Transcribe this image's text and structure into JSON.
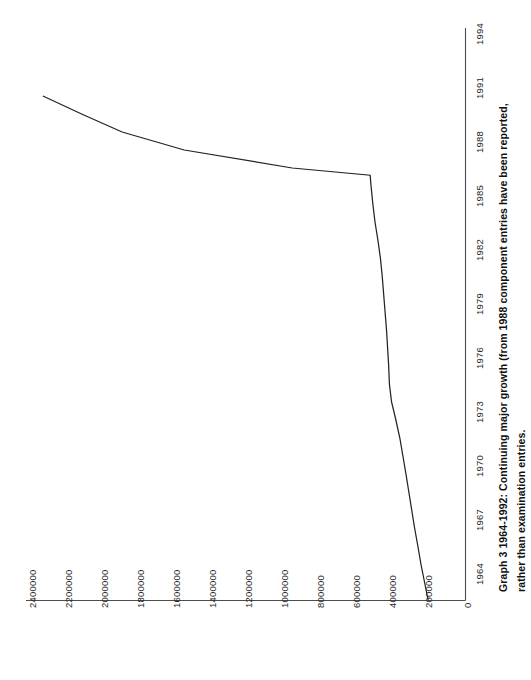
{
  "caption": {
    "line1": "Graph 3 1964-1992: Continuing major growth (from 1988 component entries have been reported,",
    "line2": "rather than examination entries."
  },
  "colors": {
    "line": "#222222",
    "axis": "#4d4d4d",
    "text": "#262626",
    "background": "#ffffff"
  },
  "chart_data": {
    "type": "line",
    "orientation": "rotated-90-ccw",
    "xlabel": "",
    "ylabel": "",
    "grid": false,
    "legend": "none",
    "xlim": [
      1964,
      1994
    ],
    "ylim": [
      0,
      2400000
    ],
    "xticks": [
      "1964",
      "1967",
      "1970",
      "1973",
      "1976",
      "1979",
      "1982",
      "1985",
      "1988",
      "1991",
      "1994"
    ],
    "yticks": [
      "0",
      "200000",
      "400000",
      "600000",
      "800000",
      "1000000",
      "1200000",
      "1400000",
      "1600000",
      "1800000",
      "2000000",
      "2200000",
      "2400000"
    ],
    "x": [
      1964,
      1965,
      1966,
      1967,
      1968,
      1969,
      1970,
      1971,
      1972,
      1973,
      1974,
      1975,
      1976,
      1977,
      1978,
      1979,
      1980,
      1981,
      1982,
      1983,
      1984,
      1985,
      1986,
      1987,
      1987.6,
      1988,
      1989,
      1990,
      1991,
      1992
    ],
    "values": [
      205000,
      225000,
      245000,
      262000,
      280000,
      296000,
      312000,
      328000,
      345000,
      362000,
      384000,
      408000,
      420000,
      424000,
      430000,
      436000,
      444000,
      452000,
      460000,
      470000,
      484000,
      500000,
      512000,
      522000,
      527000,
      960000,
      1560000,
      1905000,
      2130000,
      2345000
    ],
    "series": [
      {
        "name": "Entries",
        "values": [
          205000,
          225000,
          245000,
          262000,
          280000,
          296000,
          312000,
          328000,
          345000,
          362000,
          384000,
          408000,
          420000,
          424000,
          430000,
          436000,
          444000,
          452000,
          460000,
          470000,
          484000,
          500000,
          512000,
          522000,
          527000,
          960000,
          1560000,
          1905000,
          2130000,
          2345000
        ]
      }
    ],
    "annotations": [
      {
        "text": "discontinuity at 1988: component entries replace examination entries",
        "x": 1988
      }
    ]
  },
  "axes": {
    "value_axis_labels": [
      "2400000",
      "2200000",
      "2000000",
      "1800000",
      "1600000",
      "1400000",
      "1200000",
      "1000000",
      "800000",
      "600000",
      "400000",
      "200000",
      "0"
    ],
    "category_axis_labels": [
      "1994",
      "1991",
      "1988",
      "1985",
      "1982",
      "1979",
      "1976",
      "1973",
      "1970",
      "1967",
      "1964"
    ]
  }
}
